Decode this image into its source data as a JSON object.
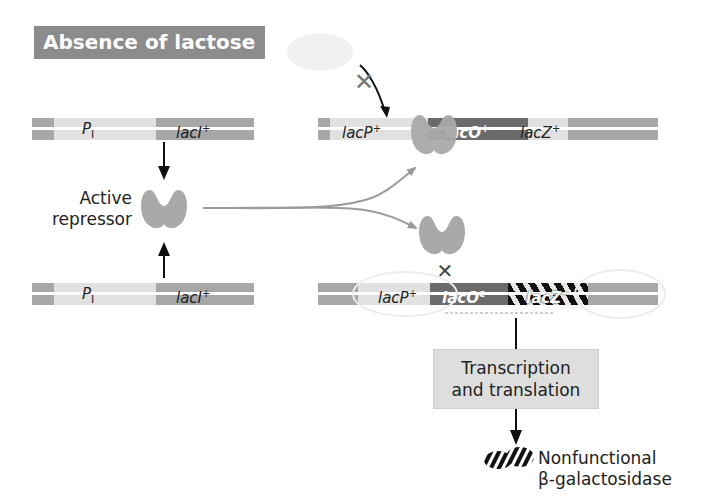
{
  "title": "Absence of lactose",
  "left": {
    "top_gene": {
      "promoter": "P",
      "promoter_sub": "I",
      "gene": "lacI",
      "gene_sup": "+"
    },
    "bottom_gene": {
      "promoter": "P",
      "promoter_sub": "I",
      "gene": "lacI",
      "gene_sup": "+"
    },
    "repressor_label_line1": "Active",
    "repressor_label_line2": "repressor"
  },
  "right_top": {
    "promoter": "lacP",
    "promoter_sup": "+",
    "operator": "lacO",
    "operator_sup": "+",
    "gene": "lacZ",
    "gene_sup": "+",
    "blocked_mark": "×"
  },
  "right_bottom": {
    "promoter": "lacP",
    "promoter_sup": "+",
    "operator": "lacO",
    "operator_sup": "c",
    "gene": "lacZ",
    "gene_sup": "−",
    "blocked_mark": "×"
  },
  "process_box": {
    "line1": "Transcription",
    "line2": "and translation"
  },
  "product": {
    "line1": "Nonfunctional",
    "line2": "β-galactosidase"
  },
  "colors": {
    "title_bg": "#8c8c8c",
    "repressor": "#a9a9a9",
    "dna_dark": "#a7a7a7",
    "dna_light": "#e1e1e1",
    "operator": "#6b6b6b",
    "box_bg": "#dedede"
  }
}
